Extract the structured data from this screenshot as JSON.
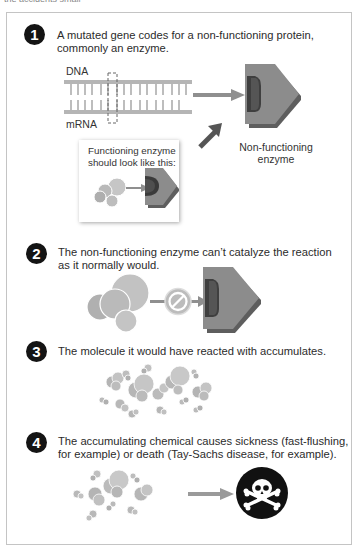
{
  "header": {
    "cutoff_text": "the accidents small"
  },
  "colors": {
    "badge": "#141414",
    "enzyme_face": "#8c8c8c",
    "enzyme_side": "#5e5e5e",
    "enzyme_pocket": "#3f3f3f",
    "molecule": "#b8b8b8",
    "arrow": "#8f8f8f",
    "frame_border": "#c4c4c4"
  },
  "steps": [
    {
      "number": "1",
      "text_line1": "A mutated gene codes for a non-functioning protein,",
      "text_line2": "commonly an enzyme.",
      "labels": {
        "dna": "DNA",
        "mrna": "mRNA",
        "nonfunc_line1": "Non-functioning",
        "nonfunc_line2": "enzyme"
      },
      "inset": {
        "line1": "Functioning enzyme",
        "line2": "should look like this:"
      },
      "icons": [
        "dna-strand",
        "mutation-marker",
        "arrow-right",
        "enzyme-nonfunctioning",
        "molecule-cluster",
        "enzyme-functioning"
      ]
    },
    {
      "number": "2",
      "text_line1": "The non-functioning enzyme can’t catalyze the reaction",
      "text_line2": "as it normally would.",
      "icons": [
        "molecule-cluster",
        "prohibited-sign",
        "enzyme-nonfunctioning"
      ]
    },
    {
      "number": "3",
      "text_line1": "The molecule it would have reacted with accumulates.",
      "icons": [
        "accumulated-molecules"
      ]
    },
    {
      "number": "4",
      "text_line1": "The accumulating chemical causes sickness (fast-flushing,",
      "text_line2": "for example) or death (Tay-Sachs disease, for example).",
      "icons": [
        "accumulated-molecules",
        "arrow-right",
        "skull-crossbones"
      ]
    }
  ]
}
